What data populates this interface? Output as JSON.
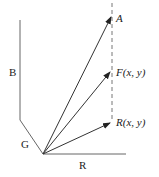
{
  "diagram": {
    "axes": {
      "R": {
        "label": "R"
      },
      "G": {
        "label": "G"
      },
      "B": {
        "label": "B"
      }
    },
    "vectors": [
      {
        "id": "A",
        "label": "A"
      },
      {
        "id": "F",
        "label": "F(x, y)"
      },
      {
        "id": "R",
        "label": "R(x, y)"
      }
    ],
    "colors": {
      "line": "#555555",
      "dashed": "#777777",
      "arrow": "#222222"
    }
  }
}
